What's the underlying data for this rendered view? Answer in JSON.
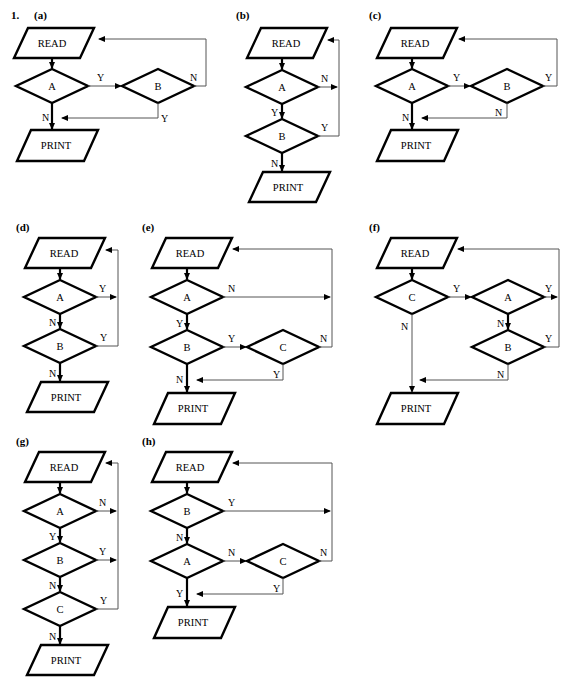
{
  "document": {
    "question_number": "1.",
    "page_width": 569,
    "page_height": 680,
    "background_color": "#ffffff",
    "ink_color": "#000000",
    "thin_line_color": "#555555",
    "node_shapes": {
      "io": "parallelogram",
      "decision": "diamond"
    }
  },
  "labels": {
    "read": "READ",
    "print": "PRINT",
    "yes": "Y",
    "no": "N",
    "a": "A",
    "b": "B",
    "c": "C"
  },
  "panels": [
    {
      "id": "a",
      "label": "(a)",
      "decisions": [
        "A",
        "B"
      ],
      "edges": [
        {
          "from": "READ",
          "to": "A",
          "label": ""
        },
        {
          "from": "A",
          "to": "B",
          "label": "Y"
        },
        {
          "from": "A",
          "to": "PRINT",
          "label": "N"
        },
        {
          "from": "B",
          "to": "READ",
          "label": "N"
        },
        {
          "from": "B",
          "to": "PRINT",
          "label": "Y"
        }
      ]
    },
    {
      "id": "b",
      "label": "(b)",
      "decisions": [
        "A",
        "B"
      ],
      "edges": [
        {
          "from": "READ",
          "to": "A",
          "label": ""
        },
        {
          "from": "A",
          "to": "READ",
          "label": "N"
        },
        {
          "from": "A",
          "to": "B",
          "label": "Y"
        },
        {
          "from": "B",
          "to": "READ",
          "label": "Y"
        },
        {
          "from": "B",
          "to": "PRINT",
          "label": "N"
        }
      ]
    },
    {
      "id": "c",
      "label": "(c)",
      "decisions": [
        "A",
        "B"
      ],
      "edges": [
        {
          "from": "READ",
          "to": "A",
          "label": ""
        },
        {
          "from": "A",
          "to": "B",
          "label": "Y"
        },
        {
          "from": "A",
          "to": "PRINT",
          "label": "N"
        },
        {
          "from": "B",
          "to": "READ",
          "label": "Y"
        },
        {
          "from": "B",
          "to": "PRINT",
          "label": "N"
        }
      ]
    },
    {
      "id": "d",
      "label": "(d)",
      "decisions": [
        "A",
        "B"
      ],
      "edges": [
        {
          "from": "READ",
          "to": "A",
          "label": ""
        },
        {
          "from": "A",
          "to": "READ",
          "label": "Y"
        },
        {
          "from": "A",
          "to": "B",
          "label": "N"
        },
        {
          "from": "B",
          "to": "READ",
          "label": "Y"
        },
        {
          "from": "B",
          "to": "PRINT",
          "label": "N"
        }
      ]
    },
    {
      "id": "e",
      "label": "(e)",
      "decisions": [
        "A",
        "B",
        "C"
      ],
      "edges": [
        {
          "from": "READ",
          "to": "A",
          "label": ""
        },
        {
          "from": "A",
          "to": "READ",
          "label": "N"
        },
        {
          "from": "A",
          "to": "B",
          "label": "Y"
        },
        {
          "from": "B",
          "to": "C",
          "label": "Y"
        },
        {
          "from": "B",
          "to": "PRINT",
          "label": "N"
        },
        {
          "from": "C",
          "to": "READ",
          "label": "N"
        },
        {
          "from": "C",
          "to": "PRINT",
          "label": "Y"
        }
      ]
    },
    {
      "id": "f",
      "label": "(f)",
      "decisions": [
        "C",
        "A",
        "B"
      ],
      "edges": [
        {
          "from": "READ",
          "to": "C",
          "label": ""
        },
        {
          "from": "C",
          "to": "A",
          "label": "Y"
        },
        {
          "from": "C",
          "to": "PRINT",
          "label": "N"
        },
        {
          "from": "A",
          "to": "READ",
          "label": "Y"
        },
        {
          "from": "A",
          "to": "B",
          "label": "N"
        },
        {
          "from": "B",
          "to": "READ",
          "label": "Y"
        },
        {
          "from": "B",
          "to": "PRINT",
          "label": "N"
        }
      ]
    },
    {
      "id": "g",
      "label": "(g)",
      "decisions": [
        "A",
        "B",
        "C"
      ],
      "edges": [
        {
          "from": "READ",
          "to": "A",
          "label": ""
        },
        {
          "from": "A",
          "to": "READ",
          "label": "N"
        },
        {
          "from": "A",
          "to": "B",
          "label": "Y"
        },
        {
          "from": "B",
          "to": "READ",
          "label": "Y"
        },
        {
          "from": "B",
          "to": "C",
          "label": "N"
        },
        {
          "from": "C",
          "to": "READ",
          "label": "Y"
        },
        {
          "from": "C",
          "to": "PRINT",
          "label": "N"
        }
      ]
    },
    {
      "id": "h",
      "label": "(h)",
      "decisions": [
        "B",
        "A",
        "C"
      ],
      "edges": [
        {
          "from": "READ",
          "to": "B",
          "label": ""
        },
        {
          "from": "B",
          "to": "READ",
          "label": "Y"
        },
        {
          "from": "B",
          "to": "A",
          "label": "N"
        },
        {
          "from": "A",
          "to": "C",
          "label": "N"
        },
        {
          "from": "A",
          "to": "PRINT",
          "label": "Y"
        },
        {
          "from": "C",
          "to": "READ",
          "label": "N"
        },
        {
          "from": "C",
          "to": "PRINT",
          "label": "Y"
        }
      ]
    }
  ]
}
